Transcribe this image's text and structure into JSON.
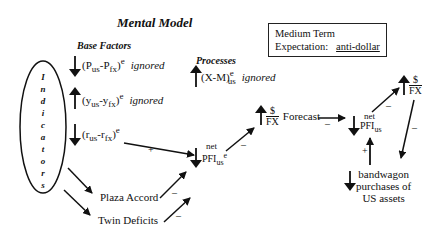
{
  "title": "Mental Model",
  "sections": {
    "base_factors": "Base Factors",
    "processes": "Processes"
  },
  "indicators": {
    "label": "Indicators",
    "letters": [
      "I",
      "n",
      "d",
      "i",
      "c",
      "a",
      "t",
      "o",
      "r",
      "s"
    ]
  },
  "base_factors": [
    {
      "direction": "down",
      "open": "(P",
      "sub1": "us",
      "mid": "-P",
      "sub2": "fx",
      "close": ")",
      "sup": "e",
      "note": "ignored"
    },
    {
      "direction": "up",
      "open": "(y",
      "sub1": "us",
      "mid": "-y",
      "sub2": "fx",
      "close": ")",
      "sup": "e",
      "note": "ignored"
    },
    {
      "direction": "down",
      "open": "(r",
      "sub1": "us",
      "mid": "-r",
      "sub2": "fx",
      "close": ")",
      "sup": "e",
      "note": ""
    }
  ],
  "processes": [
    {
      "direction": "up",
      "expr": "(X-M)",
      "sub": "us",
      "sup": "e",
      "note": "ignored"
    }
  ],
  "expectation_box": {
    "line1": "Medium Term",
    "line2_label": "Expectation:",
    "line2_value": "anti-dollar"
  },
  "nodes": {
    "pfi_expected": {
      "direction": "down",
      "top": "net",
      "main": "PFI",
      "sub": "us",
      "sup": "e"
    },
    "fx_forecast": {
      "direction": "up",
      "num": "$",
      "den": "FX",
      "label": "Forecast"
    },
    "pfi_actual": {
      "direction": "down",
      "top": "net",
      "main": "PFI",
      "sub": "us"
    },
    "fx_actual": {
      "direction": "up",
      "num": "$",
      "den": "FX"
    },
    "bandwagon": {
      "direction": "down",
      "lines": [
        "bandwagon",
        "purchases of",
        "US assets"
      ]
    },
    "plaza_accord": "Plaza Accord",
    "twin_deficits": "Twin Deficits"
  },
  "edge_signs": {
    "rates_to_pfi": "+",
    "pfi_to_forecast": "–",
    "forecast_to_pfi": "–",
    "pfi_to_fx": "–",
    "fx_to_bandwagon": "–",
    "bandwagon_to_pfi": "+",
    "plaza_to_pfi": "–",
    "twin_to_pfi": "–"
  }
}
